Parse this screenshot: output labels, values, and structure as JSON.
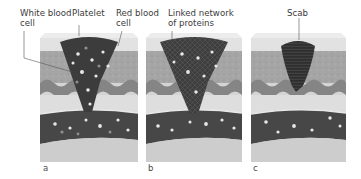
{
  "figure": {
    "panels": [
      {
        "id": "a",
        "label": "a"
      },
      {
        "id": "b",
        "label": "b"
      },
      {
        "id": "c",
        "label": "c"
      }
    ],
    "callouts": {
      "white_blood_cell": {
        "line1": "White blood",
        "line2": "cell"
      },
      "platelet": {
        "line1": "Platelet"
      },
      "red_blood_cell": {
        "line1": "Red blood",
        "line2": "cell"
      },
      "linked_network": {
        "line1": "Linked network",
        "line2": "of proteins"
      },
      "scab": {
        "line1": "Scab"
      }
    },
    "colors": {
      "skin_top": "#e4e4e4",
      "dermis": "#a9a9a9",
      "wave_layer": "#8a8a8a",
      "tissue_light": "#d8d8d8",
      "vessel": "#4a4a4a",
      "clot": "#3f3f3f",
      "scab": "#2e2e2e",
      "bottom": "#cfcfcf"
    }
  }
}
